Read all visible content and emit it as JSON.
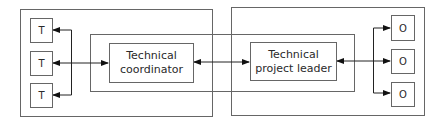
{
  "diagram": {
    "left_group": {
      "nodes": [
        {
          "label": "T"
        },
        {
          "label": "T"
        },
        {
          "label": "T"
        }
      ],
      "coordinator": {
        "line1": "Technical",
        "line2": "coordinator"
      }
    },
    "right_group": {
      "leader": {
        "line1": "Technical",
        "line2": "project leader"
      },
      "nodes": [
        {
          "label": "O"
        },
        {
          "label": "O"
        },
        {
          "label": "O"
        }
      ]
    },
    "colors": {
      "line": "#555555",
      "box_fill": "#ffffff",
      "text": "#2a2a2a"
    }
  }
}
